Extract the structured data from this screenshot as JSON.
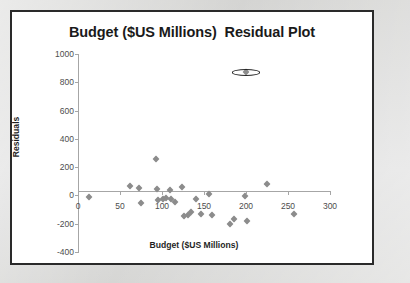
{
  "chart_card": {
    "border_color": "#2a2a2a",
    "background": "#ffffff"
  },
  "page": {
    "background": "#d9d9d7"
  },
  "chart_data": {
    "type": "scatter",
    "title": "Budget ($US Millions)  Residual Plot",
    "xlabel": "Budget ($US Millions)",
    "ylabel": "Residuals",
    "xlim": [
      0,
      300
    ],
    "ylim": [
      -400,
      1000
    ],
    "xticks": [
      "0",
      "50",
      "100",
      "150",
      "200",
      "250",
      "300"
    ],
    "xtick_values": [
      0,
      50,
      100,
      150,
      200,
      250,
      300
    ],
    "yticks": [
      "1000",
      "800",
      "600",
      "400",
      "200",
      "0",
      "-200",
      "-400"
    ],
    "ytick_values": [
      1000,
      800,
      600,
      400,
      200,
      0,
      -200,
      -400
    ],
    "grid": false,
    "legend": "none",
    "marker": "diamond",
    "marker_color": "#8c8c8c",
    "axis_color": "#a6a6a6",
    "points": [
      {
        "x": 13,
        "y": -10
      },
      {
        "x": 62,
        "y": 70
      },
      {
        "x": 73,
        "y": 55
      },
      {
        "x": 75,
        "y": -55
      },
      {
        "x": 93,
        "y": 255
      },
      {
        "x": 94,
        "y": 45
      },
      {
        "x": 95,
        "y": -30
      },
      {
        "x": 101,
        "y": -25
      },
      {
        "x": 105,
        "y": -20
      },
      {
        "x": 110,
        "y": 40
      },
      {
        "x": 111,
        "y": -28
      },
      {
        "x": 116,
        "y": -45
      },
      {
        "x": 124,
        "y": 62
      },
      {
        "x": 126,
        "y": -145
      },
      {
        "x": 131,
        "y": -140
      },
      {
        "x": 135,
        "y": -120
      },
      {
        "x": 140,
        "y": -25
      },
      {
        "x": 146,
        "y": -130
      },
      {
        "x": 156,
        "y": 12
      },
      {
        "x": 160,
        "y": -140
      },
      {
        "x": 181,
        "y": -205
      },
      {
        "x": 186,
        "y": -165
      },
      {
        "x": 199,
        "y": -5
      },
      {
        "x": 201,
        "y": -180
      },
      {
        "x": 200,
        "y": 870
      },
      {
        "x": 225,
        "y": 80
      },
      {
        "x": 257,
        "y": -130
      }
    ],
    "annotations": [
      {
        "type": "ellipse",
        "name": "outlier-highlight",
        "center_x": 200,
        "center_y": 870,
        "radius_x": 17,
        "radius_y": 23,
        "stroke": "#272727"
      }
    ]
  }
}
